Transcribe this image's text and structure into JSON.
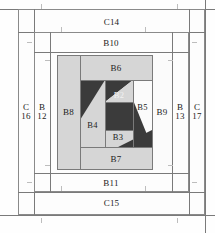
{
  "diagram": {
    "type": "quilt-block-construction-diagram",
    "title": "",
    "colors": {
      "background": "#ffffff",
      "line": "#8a8a8a",
      "light_fabric": "#d6d6d6",
      "dark_fabric": "#3b3b3b",
      "white_fabric": "#fbfbfb",
      "tick": "#bdbdbd",
      "text": "#222222"
    },
    "outer_border_strips": [
      {
        "id": "C14",
        "label": "C14",
        "position": "top"
      },
      {
        "id": "C15",
        "label": "C15",
        "position": "bottom"
      },
      {
        "id": "C16",
        "label": "C\n16",
        "label_line1": "C",
        "label_line2": "16",
        "position": "left"
      },
      {
        "id": "C17",
        "label": "C\n17",
        "label_line1": "C",
        "label_line2": "17",
        "position": "right"
      }
    ],
    "inner_border_strips": [
      {
        "id": "B10",
        "label": "B10",
        "position": "top"
      },
      {
        "id": "B11",
        "label": "B11",
        "position": "bottom"
      },
      {
        "id": "B12",
        "label": "B\n12",
        "label_line1": "B",
        "label_line2": "12",
        "position": "left"
      },
      {
        "id": "B13",
        "label": "B\n13",
        "label_line1": "B",
        "label_line2": "13",
        "position": "right"
      }
    ],
    "block_strips": [
      {
        "id": "B6",
        "label": "B6",
        "position": "top",
        "fabric": "light"
      },
      {
        "id": "B7",
        "label": "B7",
        "position": "bottom",
        "fabric": "light"
      },
      {
        "id": "B8",
        "label": "B8",
        "position": "left",
        "fabric": "light"
      },
      {
        "id": "B9",
        "label": "B9",
        "position": "right",
        "fabric": "white"
      }
    ],
    "centre_pieces": [
      {
        "id": "B2",
        "label": "B2",
        "fabric": "dark",
        "note": "upper centre square"
      },
      {
        "id": "B3",
        "label": "B3",
        "fabric": "dark",
        "note": "lower centre strip"
      },
      {
        "id": "B4",
        "label": "B4",
        "fabric": "light",
        "note": "lower-left triangle"
      },
      {
        "id": "B5",
        "label": "B5",
        "fabric": "white",
        "note": "upper-right triangle"
      }
    ],
    "all_labels": [
      "C14",
      "C15",
      "C16",
      "C17",
      "B10",
      "B11",
      "B12",
      "B13",
      "B2",
      "B3",
      "B4",
      "B5",
      "B6",
      "B7",
      "B8",
      "B9"
    ]
  }
}
